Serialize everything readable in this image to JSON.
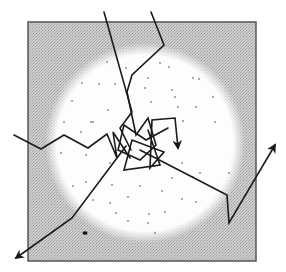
{
  "diagram": {
    "type": "random-walk-diffusion",
    "box": {
      "x": 28,
      "y": 22,
      "width": 228,
      "height": 239,
      "fill": "#c8c8c8",
      "stroke": "#555555"
    },
    "region": {
      "shape": "circle",
      "cx": 145,
      "cy": 143,
      "r": 100,
      "fill": "#fafafa"
    },
    "paths": [
      {
        "name": "walk-top-left",
        "points": [
          [
            104,
            12
          ],
          [
            132,
            112
          ],
          [
            120,
            128
          ],
          [
            131,
            150
          ]
        ],
        "arrow": false
      },
      {
        "name": "walk-top",
        "points": [
          [
            151,
            12
          ],
          [
            164,
            45
          ],
          [
            132,
            75
          ],
          [
            127,
            92
          ],
          [
            136,
            135
          ],
          [
            148,
            118
          ],
          [
            156,
            145
          ],
          [
            140,
            160
          ],
          [
            118,
            150
          ],
          [
            124,
            125
          ],
          [
            146,
            140
          ],
          [
            168,
            128
          ]
        ],
        "arrow": false
      },
      {
        "name": "walk-center-inner",
        "points": [
          [
            148,
            130
          ],
          [
            160,
            165
          ],
          [
            124,
            170
          ],
          [
            132,
            140
          ],
          [
            164,
            152
          ],
          [
            150,
            168
          ],
          [
            152,
            120
          ],
          [
            175,
            118
          ],
          [
            178,
            148
          ]
        ],
        "arrow": true
      },
      {
        "name": "walk-left",
        "points": [
          [
            14,
            135
          ],
          [
            41,
            149
          ],
          [
            64,
            135
          ],
          [
            88,
            148
          ],
          [
            107,
            134
          ],
          [
            117,
            158
          ],
          [
            113,
            132
          ],
          [
            130,
            158
          ]
        ],
        "arrow": false
      },
      {
        "name": "walk-bottom-left",
        "points": [
          [
            126,
            146
          ],
          [
            72,
            218
          ],
          [
            16,
            258
          ]
        ],
        "arrow": true
      },
      {
        "name": "walk-right",
        "points": [
          [
            140,
            150
          ],
          [
            227,
            195
          ],
          [
            229,
            223
          ],
          [
            275,
            145
          ]
        ],
        "arrow": true
      }
    ],
    "dots": [
      [
        107,
        62
      ],
      [
        126,
        68
      ],
      [
        160,
        63
      ],
      [
        169,
        67
      ],
      [
        82,
        83
      ],
      [
        99,
        84
      ],
      [
        115,
        84
      ],
      [
        148,
        78
      ],
      [
        193,
        78
      ],
      [
        172,
        90
      ],
      [
        199,
        79
      ],
      [
        72,
        101
      ],
      [
        108,
        110
      ],
      [
        145,
        88
      ],
      [
        175,
        97
      ],
      [
        213,
        97
      ],
      [
        64,
        122
      ],
      [
        93,
        122
      ],
      [
        151,
        102
      ],
      [
        178,
        107
      ],
      [
        196,
        107
      ],
      [
        183,
        121
      ],
      [
        81,
        132
      ],
      [
        91,
        122
      ],
      [
        215,
        122
      ],
      [
        61,
        153
      ],
      [
        86,
        155
      ],
      [
        110,
        163
      ],
      [
        200,
        173
      ],
      [
        229,
        173
      ],
      [
        73,
        186
      ],
      [
        86,
        182
      ],
      [
        112,
        185
      ],
      [
        140,
        186
      ],
      [
        172,
        178
      ],
      [
        193,
        177
      ],
      [
        93,
        200
      ],
      [
        110,
        203
      ],
      [
        128,
        197
      ],
      [
        162,
        191
      ],
      [
        182,
        199
      ],
      [
        196,
        202
      ],
      [
        116,
        213
      ],
      [
        149,
        214
      ],
      [
        165,
        212
      ],
      [
        128,
        221
      ],
      [
        148,
        223
      ],
      [
        155,
        233
      ],
      [
        182,
        163
      ]
    ],
    "blob": {
      "cx": 85,
      "cy": 233,
      "rx": 2.6,
      "ry": 1.8
    }
  }
}
